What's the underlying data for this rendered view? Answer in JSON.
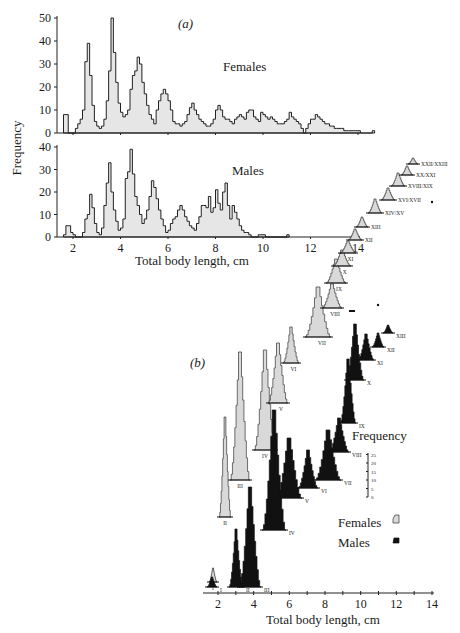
{
  "chart_data": [
    {
      "panel": "(a)",
      "type": "bar",
      "subtype": "histogram-step",
      "title": "(a)",
      "xlabel": "Total body length, cm",
      "ylabel": "Frequency",
      "xticks": [
        2,
        4,
        6,
        8,
        10,
        12,
        14
      ],
      "xlim": [
        1.3,
        14
      ],
      "grid": false,
      "series": [
        {
          "name": "Females",
          "ylim": [
            0,
            50
          ],
          "yticks": [
            0,
            10,
            20,
            30,
            40,
            50
          ],
          "bin_width_cm": 0.1,
          "x_start": 1.6,
          "values": [
            8,
            8,
            0,
            0,
            0,
            2,
            4,
            6,
            10,
            31,
            39,
            25,
            12,
            5,
            3,
            2,
            3,
            6,
            14,
            27,
            50,
            35,
            22,
            13,
            9,
            7,
            8,
            10,
            19,
            25,
            27,
            33,
            30,
            22,
            17,
            12,
            8,
            6,
            4,
            10,
            14,
            17,
            19,
            17,
            14,
            10,
            5,
            4,
            4,
            3,
            4,
            5,
            8,
            11,
            13,
            10,
            8,
            6,
            5,
            4,
            3,
            3,
            4,
            6,
            10,
            12,
            10,
            7,
            6,
            6,
            5,
            4,
            6,
            7,
            8,
            7,
            6,
            9,
            10,
            10,
            7,
            6,
            5,
            9,
            8,
            7,
            6,
            7,
            6,
            5,
            4,
            4,
            4,
            5,
            6,
            9,
            7,
            6,
            5,
            4,
            2,
            0,
            2,
            4,
            6,
            6,
            8,
            7,
            6,
            5,
            4,
            4,
            3,
            3,
            2,
            2,
            2,
            2,
            1,
            1,
            1,
            1,
            1,
            1,
            1,
            0,
            0,
            0,
            0,
            0,
            1
          ],
          "label": "Females"
        },
        {
          "name": "Males",
          "ylim": [
            0,
            40
          ],
          "yticks": [
            0,
            10,
            20,
            30,
            40
          ],
          "bin_width_cm": 0.1,
          "x_start": 1.6,
          "values": [
            1,
            5,
            5,
            2,
            1,
            0,
            0,
            0,
            2,
            8,
            10,
            19,
            13,
            6,
            2,
            1,
            4,
            14,
            24,
            33,
            20,
            12,
            7,
            3,
            4,
            8,
            26,
            29,
            39,
            28,
            18,
            14,
            10,
            6,
            8,
            12,
            18,
            25,
            22,
            17,
            12,
            8,
            5,
            2,
            3,
            6,
            8,
            9,
            12,
            14,
            12,
            9,
            7,
            5,
            4,
            3,
            6,
            9,
            14,
            14,
            13,
            18,
            11,
            13,
            21,
            15,
            12,
            20,
            24,
            14,
            8,
            14,
            11,
            8,
            5,
            3,
            2,
            2,
            1,
            0,
            0,
            0,
            1,
            1,
            1,
            0,
            0,
            0,
            0,
            0,
            0,
            0,
            0,
            0,
            1
          ],
          "label": "Males"
        }
      ]
    },
    {
      "panel": "(b)",
      "type": "bar",
      "subtype": "stacked-offset-histograms (cohorts)",
      "title": "(b)",
      "xlabel": "Total body length, cm",
      "xticks": [
        2,
        4,
        6,
        8,
        10,
        12,
        14
      ],
      "xlim": [
        1.5,
        14
      ],
      "frequency_scale": {
        "label": "Frequency",
        "ticks": [
          0,
          5,
          10,
          15,
          20,
          25
        ]
      },
      "legend": [
        {
          "label": "Females",
          "style": "stippled/hatched grey"
        },
        {
          "label": "Males",
          "style": "solid black"
        }
      ],
      "female_cohorts": [
        {
          "label": "I",
          "mode_cm": 1.8
        },
        {
          "label": "II",
          "mode_cm": 2.2
        },
        {
          "label": "III",
          "mode_cm": 3.2
        },
        {
          "label": "IV",
          "mode_cm": 3.9
        },
        {
          "label": "V",
          "mode_cm": 4.7
        },
        {
          "label": "VI",
          "mode_cm": 5.6
        },
        {
          "label": "VII",
          "mode_cm": 6.3
        },
        {
          "label": "VIII",
          "mode_cm": 7.0
        },
        {
          "label": "IX",
          "mode_cm": 7.6
        },
        {
          "label": "X",
          "mode_cm": 8.0
        },
        {
          "label": "XI",
          "mode_cm": 8.5
        },
        {
          "label": "XII",
          "mode_cm": 8.9
        },
        {
          "label": "XIII",
          "mode_cm": 9.3
        },
        {
          "label": "XIV/XV",
          "mode_cm": 9.8
        },
        {
          "label": "XVI/XVII",
          "mode_cm": 10.3
        },
        {
          "label": "XVIII/XIX",
          "mode_cm": 10.8
        },
        {
          "label": "XX/XXI",
          "mode_cm": 11.3
        },
        {
          "label": "XXII/XXIII",
          "mode_cm": 11.6
        }
      ],
      "male_cohorts": [
        {
          "label": "I",
          "mode_cm": 1.9
        },
        {
          "label": "II",
          "mode_cm": 2.5
        },
        {
          "label": "III",
          "mode_cm": 3.2
        },
        {
          "label": "IV",
          "mode_cm": 4.0
        },
        {
          "label": "V",
          "mode_cm": 4.8
        },
        {
          "label": "VI",
          "mode_cm": 5.6
        },
        {
          "label": "VII",
          "mode_cm": 6.3
        },
        {
          "label": "VIII",
          "mode_cm": 6.9
        },
        {
          "label": "IX",
          "mode_cm": 7.3
        },
        {
          "label": "X",
          "mode_cm": 7.8
        },
        {
          "label": "XI",
          "mode_cm": 8.0
        },
        {
          "label": "XII",
          "mode_cm": 8.4
        },
        {
          "label": "XIII",
          "mode_cm": 8.7
        }
      ]
    }
  ],
  "labels": {
    "panel_a": "(a)",
    "panel_b": "(b)",
    "females": "Females",
    "males": "Males",
    "ylabel": "Frequency",
    "xlabel": "Total body length, cm",
    "freq_scale_title": "Frequency",
    "legend_females": "Females",
    "legend_males": "Males"
  }
}
